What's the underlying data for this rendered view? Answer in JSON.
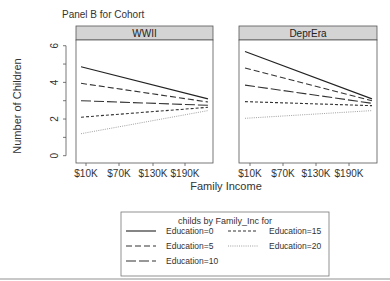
{
  "chart_data": {
    "type": "line",
    "title": "Panel B for Cohort",
    "xlabel": "Family Income",
    "ylabel": "Number of Children",
    "ylim": [
      -0.3,
      6.6
    ],
    "yticks": [
      0,
      2,
      4,
      6
    ],
    "ytick_labels": [
      "0",
      "2",
      "4",
      "6"
    ],
    "x_tick_labels": [
      "$10K",
      "$70K",
      "$130K",
      "$190K"
    ],
    "x_range": [
      "$10K",
      "$220K"
    ],
    "grid": false,
    "legend_position": "bottom",
    "legend": {
      "title": "childs by Family_Inc for",
      "entries": [
        "Education=0",
        "Education=5",
        "Education=10",
        "Education=15",
        "Education=20"
      ]
    },
    "panels": [
      {
        "name": "WWII",
        "x": [
          "$10K",
          "$220K"
        ],
        "series": [
          {
            "name": "Education=0",
            "values": [
              4.85,
              3.1
            ],
            "style": "solid"
          },
          {
            "name": "Education=5",
            "values": [
              3.95,
              2.93
            ],
            "style": "dash"
          },
          {
            "name": "Education=10",
            "values": [
              3.0,
              2.75
            ],
            "style": "longdash"
          },
          {
            "name": "Education=15",
            "values": [
              2.1,
              2.64
            ],
            "style": "shortdash"
          },
          {
            "name": "Education=20",
            "values": [
              1.2,
              2.46
            ],
            "style": "dotted"
          }
        ]
      },
      {
        "name": "DeprEra",
        "x": [
          "$10K",
          "$220K"
        ],
        "series": [
          {
            "name": "Education=0",
            "values": [
              5.68,
              3.1
            ],
            "style": "solid"
          },
          {
            "name": "Education=5",
            "values": [
              4.78,
              3.0
            ],
            "style": "dash"
          },
          {
            "name": "Education=10",
            "values": [
              3.85,
              2.86
            ],
            "style": "longdash"
          },
          {
            "name": "Education=15",
            "values": [
              2.95,
              2.73
            ],
            "style": "shortdash"
          },
          {
            "name": "Education=20",
            "values": [
              2.04,
              2.46
            ],
            "style": "dotted"
          }
        ]
      }
    ]
  },
  "colors": {
    "strip_fill": "#d4d4d4",
    "frame": "#555555",
    "line": "#333333"
  }
}
